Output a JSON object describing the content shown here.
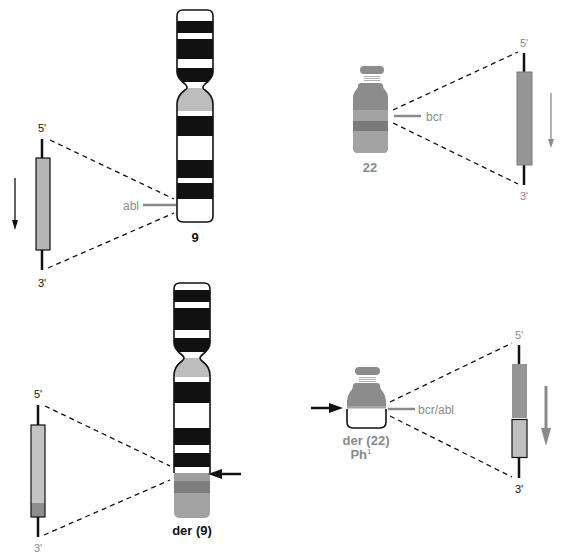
{
  "colors": {
    "black": "#111111",
    "gray_text": "#8a8a8a",
    "chr22_medium": "#8c8c8c",
    "chr22_light": "#a9a9a9",
    "chr22_dark": "#7a7a7a",
    "chr9_gray": "#bdbdbd",
    "gene_gray": "#a0a0a0",
    "gene_light": "#c4c4c4",
    "dashed": "#111111"
  },
  "chr9": {
    "label": "9",
    "gene_label": "abl",
    "gene_top": {
      "five_prime": "5'",
      "three_prime": "3'"
    }
  },
  "chr22": {
    "label": "22",
    "gene_label": "bcr",
    "gene_top": {
      "five_prime": "5'",
      "three_prime": "3'"
    }
  },
  "der9": {
    "label": "der (9)",
    "gene": {
      "five_prime": "5'",
      "three_prime": "3'"
    }
  },
  "der22": {
    "label": "der (22)",
    "sublabel": "Ph",
    "superscript": "1",
    "gene_label": "bcr/abl",
    "gene": {
      "five_prime": "5'",
      "three_prime": "3'"
    }
  }
}
